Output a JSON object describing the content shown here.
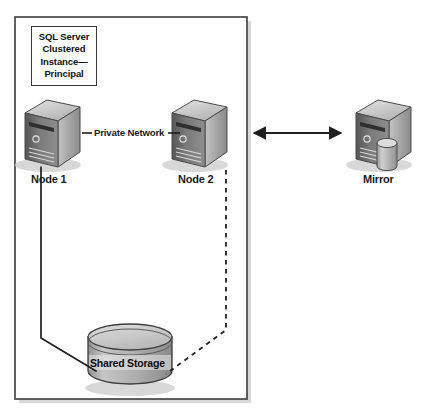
{
  "diagram": {
    "cluster_box": {
      "label_lines": [
        "SQL Server",
        "Clustered",
        "Instance—",
        "Principal"
      ]
    },
    "nodes": [
      {
        "id": "node1",
        "label": "Node 1",
        "type": "server-tower"
      },
      {
        "id": "node2",
        "label": "Node 2",
        "type": "server-tower"
      },
      {
        "id": "mirror",
        "label": "Mirror",
        "type": "server-tower-with-database"
      }
    ],
    "storage": {
      "label": "Shared Storage",
      "type": "cylinder"
    },
    "connections": [
      {
        "id": "private-network",
        "label": "Private Network",
        "style": "solid",
        "from": "node1",
        "to": "node2"
      },
      {
        "id": "node1-to-storage",
        "label": "",
        "style": "solid",
        "from": "node1",
        "to": "storage"
      },
      {
        "id": "node2-to-storage",
        "label": "",
        "style": "dashed",
        "from": "node2",
        "to": "storage"
      },
      {
        "id": "principal-to-mirror",
        "label": "",
        "style": "double-arrow",
        "from": "cluster",
        "to": "mirror"
      }
    ],
    "colors": {
      "outline": "#3b3b3b",
      "line": "#2b2b2b",
      "server_front": "#6e6e6e",
      "server_side": "#a8a8a8",
      "server_top": "#c9c9c9",
      "cylinder_fill": "#b5b5b5",
      "shadow": "#d6d6d6",
      "background": "#ffffff"
    }
  }
}
